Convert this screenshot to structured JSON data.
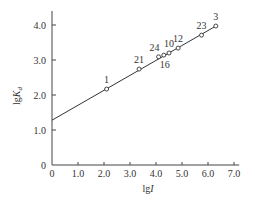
{
  "chart_data": {
    "type": "scatter",
    "title": "",
    "xlabel": "lgI",
    "ylabel": "lgKd",
    "xlim": [
      0,
      7.2
    ],
    "ylim": [
      0,
      4.4
    ],
    "xticks": [
      "0",
      "1.0",
      "2.0",
      "3.0",
      "4.0",
      "5.0",
      "6.0",
      "7.0"
    ],
    "yticks": [
      "0",
      "1.0",
      "2.0",
      "3.0",
      "4.0"
    ],
    "grid": false,
    "legend": null,
    "series": [
      {
        "name": "data points",
        "marker": "open-circle",
        "points": [
          {
            "label": "1",
            "x": 2.1,
            "y": 2.17
          },
          {
            "label": "21",
            "x": 3.35,
            "y": 2.74
          },
          {
            "label": "24",
            "x": 4.1,
            "y": 3.09
          },
          {
            "label": "16",
            "x": 4.3,
            "y": 3.14
          },
          {
            "label": "10",
            "x": 4.5,
            "y": 3.2
          },
          {
            "label": "12",
            "x": 4.85,
            "y": 3.34
          },
          {
            "label": "23",
            "x": 5.75,
            "y": 3.71
          },
          {
            "label": "3",
            "x": 6.3,
            "y": 3.97
          }
        ]
      },
      {
        "name": "fit line",
        "type": "line",
        "points": [
          {
            "x": 0,
            "y": 1.28
          },
          {
            "x": 6.3,
            "y": 3.97
          }
        ]
      }
    ]
  }
}
